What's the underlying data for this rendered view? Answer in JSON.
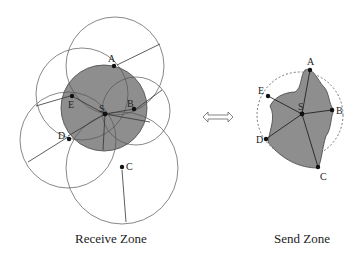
{
  "receive_zone": {
    "caption": "Receive Zone",
    "nodes": [
      {
        "id": "A",
        "label": "A"
      },
      {
        "id": "B",
        "label": "B"
      },
      {
        "id": "C",
        "label": "C"
      },
      {
        "id": "D",
        "label": "D"
      },
      {
        "id": "E",
        "label": "E"
      },
      {
        "id": "S",
        "label": "S"
      }
    ]
  },
  "send_zone": {
    "caption": "Send Zone",
    "nodes": [
      {
        "id": "A",
        "label": "A"
      },
      {
        "id": "B",
        "label": "B"
      },
      {
        "id": "C",
        "label": "C"
      },
      {
        "id": "D",
        "label": "D"
      },
      {
        "id": "E",
        "label": "E"
      },
      {
        "id": "S",
        "label": "S"
      }
    ]
  },
  "connector": {
    "icon": "double-arrow-icon"
  },
  "colors": {
    "shade": "#8c8c8c",
    "line": "#333333"
  }
}
